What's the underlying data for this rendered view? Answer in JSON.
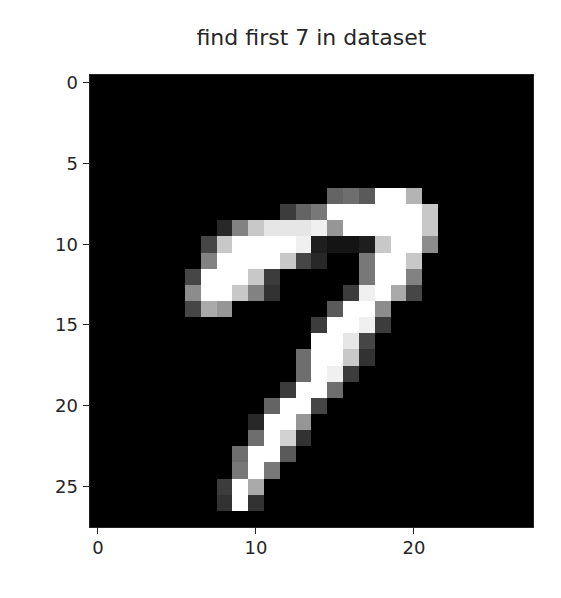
{
  "chart_data": {
    "type": "heatmap",
    "title": "find first 7 in dataset",
    "colormap": "gray",
    "xlabel": "",
    "ylabel": "",
    "shape": [
      28,
      28
    ],
    "xlim": [
      -0.5,
      27.5
    ],
    "ylim": [
      27.5,
      -0.5
    ],
    "xticks": [
      0,
      10,
      20
    ],
    "yticks": [
      0,
      5,
      10,
      15,
      20,
      25
    ],
    "xtick_labels": [
      "0",
      "10",
      "20"
    ],
    "ytick_labels": [
      "0",
      "5",
      "10",
      "15",
      "20",
      "25"
    ],
    "grid": false,
    "legend": null,
    "nonzero_pixels": [
      {
        "row": 7,
        "cols": {
          "15": 100,
          "16": 110,
          "17": 90,
          "18": 255,
          "19": 255,
          "20": 180
        }
      },
      {
        "row": 8,
        "cols": {
          "12": 60,
          "13": 100,
          "14": 120,
          "15": 255,
          "16": 255,
          "17": 255,
          "18": 255,
          "19": 255,
          "20": 255,
          "21": 200
        }
      },
      {
        "row": 9,
        "cols": {
          "8": 40,
          "9": 130,
          "10": 200,
          "11": 230,
          "12": 230,
          "13": 230,
          "14": 240,
          "15": 150,
          "16": 255,
          "17": 255,
          "18": 255,
          "19": 255,
          "20": 255,
          "21": 200
        }
      },
      {
        "row": 10,
        "cols": {
          "7": 70,
          "8": 200,
          "9": 255,
          "10": 255,
          "11": 255,
          "12": 255,
          "13": 240,
          "14": 30,
          "15": 20,
          "16": 20,
          "17": 30,
          "18": 200,
          "19": 255,
          "20": 255,
          "21": 140
        }
      },
      {
        "row": 11,
        "cols": {
          "7": 130,
          "8": 255,
          "9": 255,
          "10": 255,
          "11": 255,
          "12": 200,
          "13": 70,
          "14": 40,
          "17": 120,
          "18": 255,
          "19": 255,
          "20": 200
        }
      },
      {
        "row": 12,
        "cols": {
          "6": 70,
          "7": 255,
          "8": 255,
          "9": 255,
          "10": 200,
          "11": 60,
          "17": 120,
          "18": 255,
          "19": 255,
          "20": 130
        }
      },
      {
        "row": 13,
        "cols": {
          "6": 140,
          "7": 255,
          "8": 255,
          "9": 200,
          "10": 130,
          "11": 50,
          "16": 60,
          "17": 240,
          "18": 255,
          "19": 170,
          "20": 70
        }
      },
      {
        "row": 14,
        "cols": {
          "6": 70,
          "7": 170,
          "8": 150,
          "15": 90,
          "16": 255,
          "17": 255,
          "18": 140
        }
      },
      {
        "row": 15,
        "cols": {
          "14": 60,
          "15": 255,
          "16": 255,
          "17": 240,
          "18": 60
        }
      },
      {
        "row": 16,
        "cols": {
          "14": 255,
          "15": 255,
          "16": 230,
          "17": 70
        }
      },
      {
        "row": 17,
        "cols": {
          "13": 110,
          "14": 255,
          "15": 255,
          "16": 200,
          "17": 50
        }
      },
      {
        "row": 18,
        "cols": {
          "13": 110,
          "14": 255,
          "15": 240,
          "16": 60
        }
      },
      {
        "row": 19,
        "cols": {
          "12": 60,
          "13": 255,
          "14": 255,
          "15": 110
        }
      },
      {
        "row": 20,
        "cols": {
          "11": 100,
          "12": 255,
          "13": 255,
          "14": 70
        }
      },
      {
        "row": 21,
        "cols": {
          "10": 40,
          "11": 255,
          "12": 255,
          "13": 150
        }
      },
      {
        "row": 22,
        "cols": {
          "10": 110,
          "11": 255,
          "12": 210,
          "13": 50
        }
      },
      {
        "row": 23,
        "cols": {
          "9": 110,
          "10": 255,
          "11": 255,
          "12": 90
        }
      },
      {
        "row": 24,
        "cols": {
          "9": 120,
          "10": 255,
          "11": 120
        }
      },
      {
        "row": 25,
        "cols": {
          "8": 60,
          "9": 255,
          "10": 170
        }
      },
      {
        "row": 26,
        "cols": {
          "8": 50,
          "9": 255,
          "10": 50
        }
      }
    ]
  }
}
